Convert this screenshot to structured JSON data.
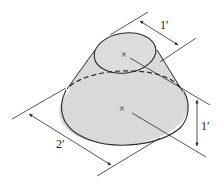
{
  "diagram": {
    "type": "technical-drawing",
    "colors": {
      "fill": "#d9d9d9",
      "stroke": "#2a2a2a",
      "background": "#ffffff"
    },
    "dimensions": {
      "top_diameter": {
        "label": "1′",
        "value": 1,
        "unit": "ft"
      },
      "height": {
        "label": "1′",
        "value": 1,
        "unit": "ft"
      },
      "base_diameter": {
        "label": "2′",
        "value": 2,
        "unit": "ft"
      }
    },
    "markers": {
      "top_center": "×",
      "base_center": "×"
    }
  }
}
